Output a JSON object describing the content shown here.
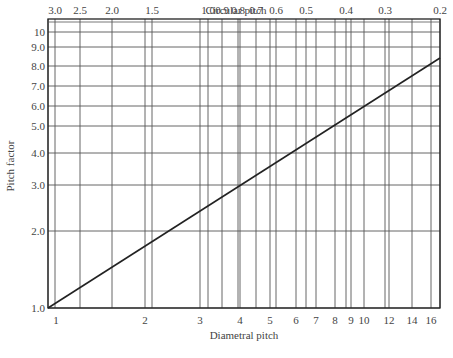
{
  "chart_data": {
    "type": "line",
    "title": "",
    "xlabel": "Diametral pitch",
    "ylabel": "Pitch factor",
    "x2label": "Circular pitch",
    "xscale": "log",
    "yscale": "log",
    "xlim": [
      1,
      16
    ],
    "ylim": [
      1,
      10
    ],
    "grid": true,
    "x_ticks": [
      "1",
      "2",
      "3",
      "4",
      "5",
      "6",
      "7",
      "8",
      "9",
      "10",
      "12",
      "14",
      "16"
    ],
    "x2_ticks": [
      "3.0",
      "2.5",
      "2.0",
      "1.5",
      "1.0",
      "0.9",
      "0.8",
      "0.7",
      "0.6",
      "0.5",
      "0.4",
      "0.3",
      "0.2"
    ],
    "y_ticks": [
      "1.0",
      "2.0",
      "3.0",
      "4.0",
      "5.0",
      "6.0",
      "7.0",
      "8.0",
      "9.0",
      "10"
    ],
    "series": [
      {
        "name": "Pitch factor vs. diametral pitch",
        "x": [
          1,
          16
        ],
        "y": [
          1.0,
          9.0
        ]
      }
    ]
  },
  "labels": {
    "top_axis_title": "Circular pitch",
    "bottom_axis_title": "Diametral pitch",
    "left_axis_title": "Pitch factor"
  },
  "geometry": {
    "plot": {
      "left": 48,
      "right": 440,
      "top": 19,
      "bottom": 308
    },
    "y_positions": {
      "1.0": 308,
      "2.0": 231,
      "3.0": 185,
      "4.0": 153,
      "5.0": 126,
      "6.0": 106,
      "7.0": 86,
      "8.0": 66,
      "9.0": 47,
      "10": 32
    },
    "bottom_positions": {
      "1": 48,
      "2": 145,
      "3": 200,
      "4": 240,
      "5": 270,
      "6": 296,
      "7": 316,
      "8": 335,
      "9": 351,
      "10": 364,
      "12": 389,
      "14": 412,
      "16": 431
    },
    "top_positions": {
      "3.0": 55,
      "2.5": 80,
      "2.0": 112,
      "1.5": 152,
      "1.0": 208,
      "0.9": 222,
      "0.8": 238,
      "0.7": 256,
      "0.6": 276,
      "0.5": 306,
      "0.4": 346,
      "0.3": 385,
      "0.2": 440
    },
    "line": {
      "x1": 48,
      "y1": 308,
      "x2": 440,
      "y2": 58
    }
  }
}
